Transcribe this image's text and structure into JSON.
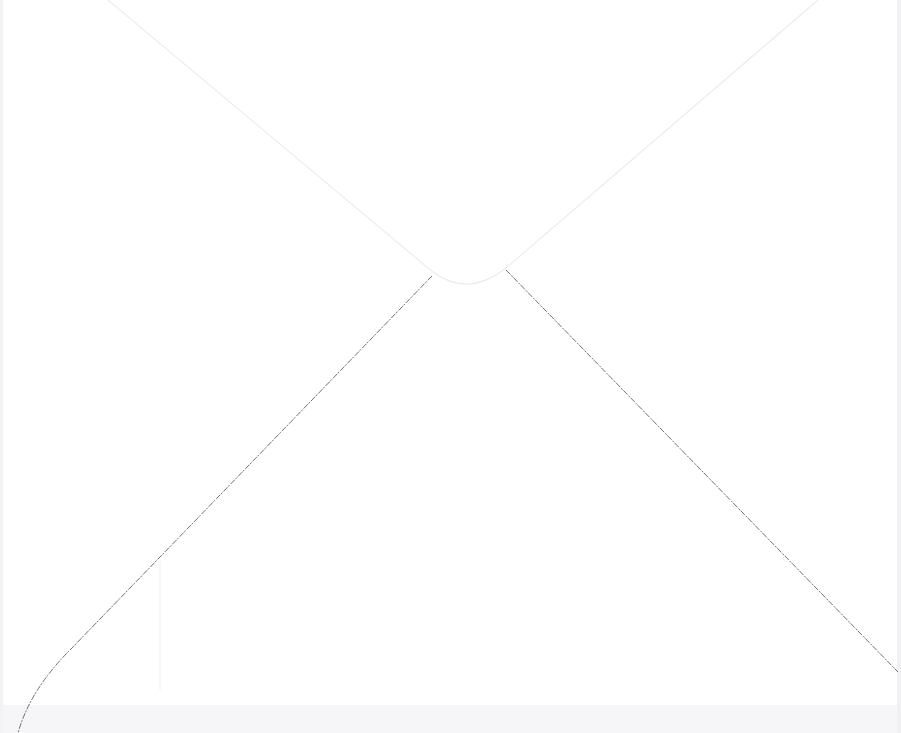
{
  "scene": {
    "subject": "back of white envelope",
    "colors": {
      "paper": "#ffffff",
      "flap_edge": "#e9e9ec",
      "bottom_fold_line": "#6a6a70",
      "shadow_bottom": "#f4f4f6"
    }
  }
}
